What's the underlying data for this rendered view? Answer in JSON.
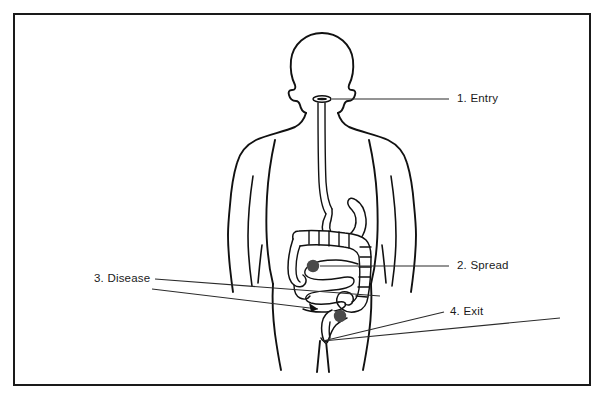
{
  "figure": {
    "background_color": "#ffffff",
    "line_color": "#111111",
    "frame_color": "#1a1a1a",
    "lesion_color": "#4a4a4a"
  },
  "frame": {
    "x": 14,
    "y": 14,
    "width": 576,
    "height": 371
  },
  "callouts": [
    {
      "id": "entry",
      "label": "1. Entry",
      "number": "1.",
      "text": "Entry",
      "target": "mouth",
      "leader_from_x": 449,
      "leader_from_y": 99,
      "leader_to_x": 330,
      "leader_to_y": 99
    },
    {
      "id": "spread",
      "label": "2. Spread",
      "number": "2.",
      "text": "Spread",
      "target": "small-intestine",
      "leader_from_x": 449,
      "leader_from_y": 266,
      "leader_to_x": 318,
      "leader_to_y": 266
    },
    {
      "id": "disease",
      "label": "3. Disease",
      "number": "3.",
      "text": "Disease",
      "target": "colon",
      "leader_from_x": 155,
      "leader_from_y": 279,
      "leader_to_x": 313,
      "leader_to_y": 308
    },
    {
      "id": "exit",
      "label": "4. Exit",
      "number": "4.",
      "text": "Exit",
      "target": "anus",
      "leader_from_x": 444,
      "leader_from_y": 312,
      "leader_to_x": 323,
      "leader_to_y": 341
    }
  ],
  "anatomy": {
    "parts": [
      {
        "name": "head",
        "label": "Head"
      },
      {
        "name": "neck",
        "label": "Neck"
      },
      {
        "name": "torso",
        "label": "Torso"
      },
      {
        "name": "arms",
        "label": "Arms"
      },
      {
        "name": "legs",
        "label": "Legs"
      },
      {
        "name": "mouth",
        "label": "Mouth"
      },
      {
        "name": "esophagus",
        "label": "Esophagus"
      },
      {
        "name": "stomach",
        "label": "Stomach"
      },
      {
        "name": "small-intestine",
        "label": "Small intestine"
      },
      {
        "name": "large-intestine",
        "label": "Large intestine"
      },
      {
        "name": "appendix",
        "label": "Appendix"
      },
      {
        "name": "rectum",
        "label": "Rectum"
      },
      {
        "name": "anus",
        "label": "Anus"
      }
    ]
  },
  "lesions": [
    {
      "id": "lesion-spread",
      "cx": 313,
      "cy": 266,
      "r": 6.2,
      "color": "#4a4a4a"
    },
    {
      "id": "lesion-exit",
      "cx": 340,
      "cy": 316,
      "r": 6.2,
      "color": "#4a4a4a"
    }
  ]
}
